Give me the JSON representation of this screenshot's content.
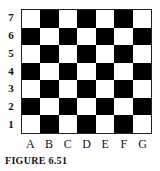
{
  "figure": {
    "caption": "FIGURE 6.51",
    "rows": [
      "7",
      "6",
      "5",
      "4",
      "3",
      "2",
      "1"
    ],
    "columns": [
      "A",
      "B",
      "C",
      "D",
      "E",
      "F",
      "G"
    ],
    "top_left_color": "white",
    "colors": {
      "dark": "#000000",
      "light": "#ffffff"
    }
  }
}
